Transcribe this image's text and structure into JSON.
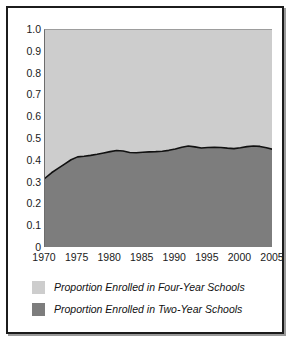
{
  "chart_data": {
    "type": "area",
    "title": "",
    "subtitle": "",
    "xlabel": "",
    "ylabel": "",
    "stacked": true,
    "grid": false,
    "legend_position": "bottom-left",
    "xlim": [
      1970,
      2005
    ],
    "ylim": [
      0,
      1.0
    ],
    "x_ticks": [
      "1970",
      "1975",
      "1980",
      "1985",
      "1990",
      "1995",
      "2000",
      "2005"
    ],
    "y_ticks": [
      "1.0",
      "0.9",
      "0.8",
      "0.7",
      "0.6",
      "0.5",
      "0.4",
      "0.3",
      "0.2",
      "0.1",
      "0"
    ],
    "x": [
      1970,
      1971,
      1972,
      1973,
      1974,
      1975,
      1976,
      1977,
      1978,
      1979,
      1980,
      1981,
      1982,
      1983,
      1984,
      1985,
      1986,
      1987,
      1988,
      1989,
      1990,
      1991,
      1992,
      1993,
      1994,
      1995,
      1996,
      1997,
      1998,
      1999,
      2000,
      2001,
      2002,
      2003,
      2004,
      2005
    ],
    "series": [
      {
        "name": "Proportion Enrolled in Two-Year Schools",
        "color": "#7d7d7d",
        "values": [
          0.32,
          0.345,
          0.365,
          0.385,
          0.405,
          0.418,
          0.421,
          0.425,
          0.43,
          0.436,
          0.442,
          0.447,
          0.445,
          0.438,
          0.437,
          0.439,
          0.441,
          0.442,
          0.444,
          0.448,
          0.454,
          0.462,
          0.468,
          0.464,
          0.459,
          0.461,
          0.462,
          0.461,
          0.458,
          0.456,
          0.46,
          0.465,
          0.468,
          0.466,
          0.46,
          0.452
        ]
      },
      {
        "name": "Proportion Enrolled in Four-Year Schools",
        "color": "#cdcdcd",
        "values": [
          0.68,
          0.655,
          0.635,
          0.615,
          0.595,
          0.582,
          0.579,
          0.575,
          0.57,
          0.564,
          0.558,
          0.553,
          0.555,
          0.562,
          0.563,
          0.561,
          0.559,
          0.558,
          0.556,
          0.552,
          0.546,
          0.538,
          0.532,
          0.536,
          0.541,
          0.539,
          0.538,
          0.539,
          0.542,
          0.544,
          0.54,
          0.535,
          0.532,
          0.534,
          0.54,
          0.548
        ]
      }
    ],
    "boundary_line_color": "#111111"
  },
  "legend": {
    "items": [
      {
        "label": "Proportion Enrolled in Four-Year Schools",
        "swatch": "light"
      },
      {
        "label": "Proportion Enrolled in Two-Year Schools",
        "swatch": "dark"
      }
    ]
  },
  "colors": {
    "four_year": "#cdcdcd",
    "two_year": "#7d7d7d",
    "frame": "#1c1c1c",
    "text": "#1a1a1a"
  }
}
